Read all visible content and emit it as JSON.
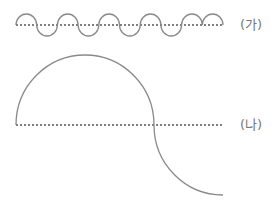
{
  "diagram": {
    "colors": {
      "curve": "#8a8a8a",
      "baseline": "#555555",
      "label": "#777777",
      "background": "#ffffff"
    },
    "panels": [
      {
        "id": "ga",
        "label": "(가)",
        "description": "short-wavelength wave of 5 crests along dotted baseline",
        "baseline_y": 25,
        "x_start": 16,
        "x_end": 223,
        "wave_count": 5,
        "amplitude": 11
      },
      {
        "id": "na",
        "label": "(나)",
        "description": "long-wavelength wave: one large crest followed by descending trough quarter arc",
        "baseline_y": 125,
        "x_start": 16,
        "x_cross": 154,
        "x_end": 223,
        "amplitude": 70
      }
    ]
  }
}
